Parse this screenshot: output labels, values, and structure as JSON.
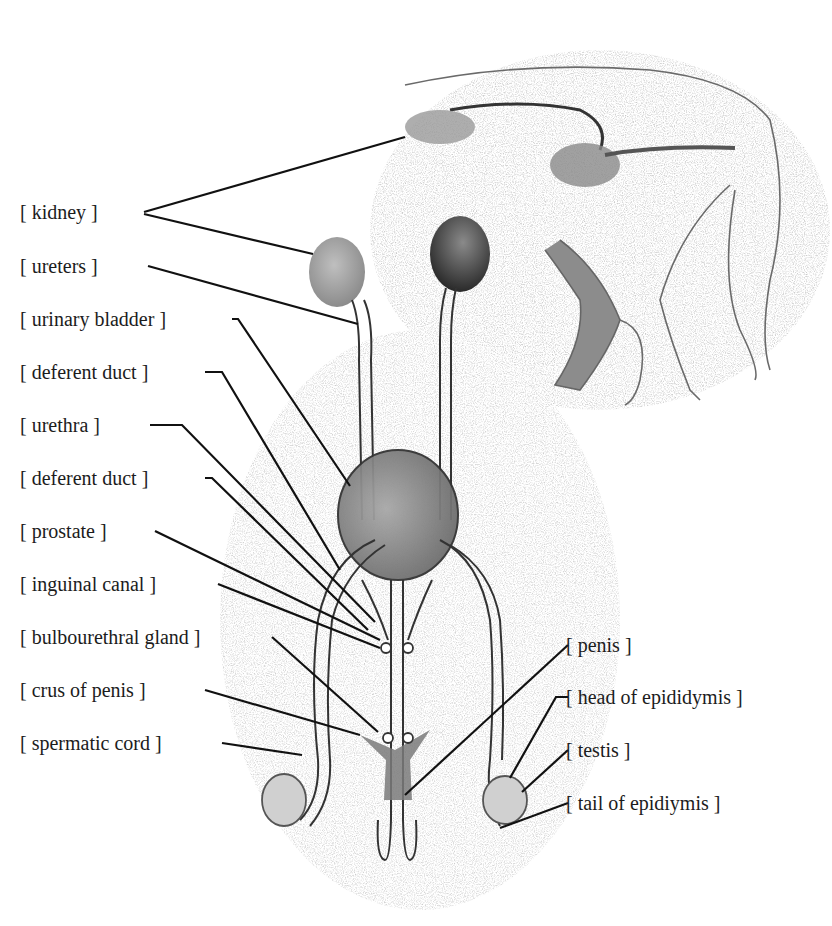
{
  "diagram": {
    "title": "",
    "colors": {
      "line": "#111111",
      "organ_fill": "#9a9a9a",
      "organ_dark": "#3a3a3a",
      "stipple": "#bdbdbd",
      "background": "#ffffff"
    },
    "labels_left": [
      {
        "id": "kidney",
        "text": "kidney"
      },
      {
        "id": "ureters",
        "text": "ureters"
      },
      {
        "id": "urinary-bladder",
        "text": "urinary bladder"
      },
      {
        "id": "deferent-duct-1",
        "text": "deferent duct"
      },
      {
        "id": "urethra",
        "text": "urethra"
      },
      {
        "id": "deferent-duct-2",
        "text": "deferent duct"
      },
      {
        "id": "prostate",
        "text": "prostate"
      },
      {
        "id": "inguinal-canal",
        "text": "inguinal canal"
      },
      {
        "id": "bulbourethral-gland",
        "text": "bulbourethral gland"
      },
      {
        "id": "crus-of-penis",
        "text": "crus of penis"
      },
      {
        "id": "spermatic-cord",
        "text": "spermatic cord"
      }
    ],
    "labels_right": [
      {
        "id": "penis",
        "text": "penis"
      },
      {
        "id": "head-of-epididymis",
        "text": "head of epididymis"
      },
      {
        "id": "testis",
        "text": "testis"
      },
      {
        "id": "tail-of-epididymis",
        "text": "tail of epidiymis"
      }
    ],
    "bracket_open": "[",
    "bracket_close": "]"
  }
}
